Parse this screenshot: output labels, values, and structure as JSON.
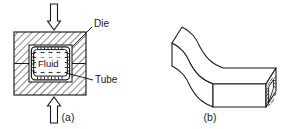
{
  "figure": {
    "background_color": "#ffffff",
    "line_color": "#1a1a1a",
    "hatch_color": "#2b2b2b",
    "panels": [
      {
        "id": "a",
        "caption": "(a)",
        "description": "Tube with pressurized fluid inside a closed split die under axial/vertical compression",
        "labels": [
          {
            "name": "die",
            "text": "Die"
          },
          {
            "name": "tube",
            "text": "Tube"
          },
          {
            "name": "fluid",
            "text": "Fluid"
          }
        ],
        "arrows": [
          {
            "name": "top-force-arrow",
            "direction": "down"
          },
          {
            "name": "bottom-force-arrow",
            "direction": "up"
          }
        ]
      },
      {
        "id": "b",
        "caption": "(b)",
        "description": "Resulting S-shaped hydroformed rectangular tube part shown in isometric view",
        "labels": [],
        "arrows": []
      }
    ],
    "captions": {
      "panel_a": "(a)",
      "panel_b": "(b)"
    },
    "callouts": {
      "die": "Die",
      "tube": "Tube",
      "fluid": "Fluid"
    }
  }
}
